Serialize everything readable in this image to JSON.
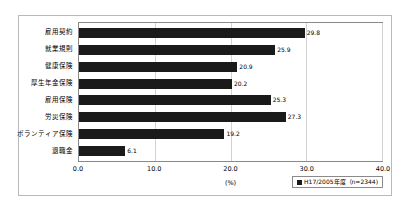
{
  "chart_data": {
    "type": "bar",
    "orientation": "horizontal",
    "title": "",
    "xlabel": "(%)",
    "ylabel": "",
    "xlim": [
      0.0,
      40.0
    ],
    "xticks": [
      "0.0",
      "10.0",
      "20.0",
      "30.0",
      "40.0"
    ],
    "xtick_values": [
      0.0,
      10.0,
      20.0,
      30.0,
      40.0
    ],
    "grid": true,
    "grid_axis": "x",
    "legend_position": "bottom-right",
    "categories": [
      "雇用契約",
      "就業規則",
      "健康保険",
      "厚生年金保険",
      "雇用保険",
      "労災保険",
      "ボランティア保険",
      "退職金"
    ],
    "values": [
      29.8,
      25.9,
      20.9,
      20.2,
      25.3,
      27.3,
      19.2,
      6.1
    ],
    "value_labels": [
      "29.8",
      "25.9",
      "20.9",
      "20.2",
      "25.3",
      "27.3",
      "19.2",
      "6.1"
    ],
    "series": [
      {
        "name": "H17/2005年度（n=2344)",
        "values": [
          29.8,
          25.9,
          20.9,
          20.2,
          25.3,
          27.3,
          19.2,
          6.1
        ],
        "color": "#1a1a1a"
      }
    ],
    "legend": [
      "H17/2005年度（n=2344)"
    ]
  },
  "colors": {
    "bar": "#1a1a1a",
    "grid": "#d2d2d2",
    "axis": "#8a8a8a",
    "frame": "#b9b9b9",
    "background": "#ffffff"
  }
}
